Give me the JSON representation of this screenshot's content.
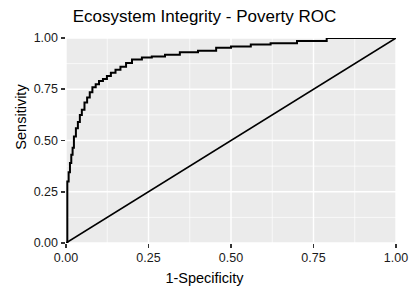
{
  "chart_data": {
    "type": "line",
    "title": "Ecosystem Integrity - Poverty ROC",
    "xlabel": "1-Specificity",
    "ylabel": "Sensitivity",
    "xlim": [
      0.0,
      1.0
    ],
    "ylim": [
      0.0,
      1.0
    ],
    "grid": true,
    "legend": "none",
    "panel_background": "#ebebeb",
    "grid_color": "#ffffff",
    "line_color": "#000000",
    "xticks": [
      "0.00",
      "0.25",
      "0.50",
      "0.75",
      "1.00"
    ],
    "xtick_values": [
      0.0,
      0.25,
      0.5,
      0.75,
      1.0
    ],
    "yticks": [
      "0.00",
      "0.25",
      "0.50",
      "0.75",
      "1.00"
    ],
    "ytick_values": [
      0.0,
      0.25,
      0.5,
      0.75,
      1.0
    ],
    "series": [
      {
        "name": "ROC curve",
        "x": [
          0.0,
          0.004,
          0.004,
          0.008,
          0.008,
          0.012,
          0.012,
          0.016,
          0.016,
          0.02,
          0.02,
          0.024,
          0.024,
          0.03,
          0.03,
          0.036,
          0.036,
          0.042,
          0.042,
          0.048,
          0.048,
          0.056,
          0.056,
          0.064,
          0.064,
          0.072,
          0.072,
          0.08,
          0.08,
          0.09,
          0.09,
          0.1,
          0.1,
          0.112,
          0.112,
          0.124,
          0.124,
          0.136,
          0.136,
          0.15,
          0.15,
          0.165,
          0.165,
          0.182,
          0.182,
          0.2,
          0.2,
          0.23,
          0.23,
          0.26,
          0.26,
          0.3,
          0.3,
          0.345,
          0.345,
          0.4,
          0.4,
          0.455,
          0.455,
          0.5,
          0.5,
          0.56,
          0.56,
          0.62,
          0.62,
          0.7,
          0.7,
          0.79,
          0.79,
          1.0
        ],
        "y": [
          0.0,
          0.0,
          0.3,
          0.3,
          0.345,
          0.345,
          0.39,
          0.39,
          0.43,
          0.43,
          0.465,
          0.465,
          0.52,
          0.52,
          0.56,
          0.56,
          0.59,
          0.59,
          0.625,
          0.625,
          0.65,
          0.65,
          0.685,
          0.685,
          0.71,
          0.71,
          0.735,
          0.735,
          0.76,
          0.76,
          0.775,
          0.775,
          0.79,
          0.79,
          0.8,
          0.8,
          0.815,
          0.815,
          0.83,
          0.83,
          0.845,
          0.845,
          0.86,
          0.86,
          0.878,
          0.878,
          0.895,
          0.895,
          0.905,
          0.905,
          0.91,
          0.91,
          0.918,
          0.918,
          0.93,
          0.93,
          0.938,
          0.938,
          0.952,
          0.952,
          0.958,
          0.958,
          0.968,
          0.968,
          0.975,
          0.975,
          0.985,
          0.985,
          1.0,
          1.0
        ]
      },
      {
        "name": "Chance diagonal",
        "x": [
          0.0,
          1.0
        ],
        "y": [
          0.0,
          1.0
        ]
      }
    ]
  }
}
